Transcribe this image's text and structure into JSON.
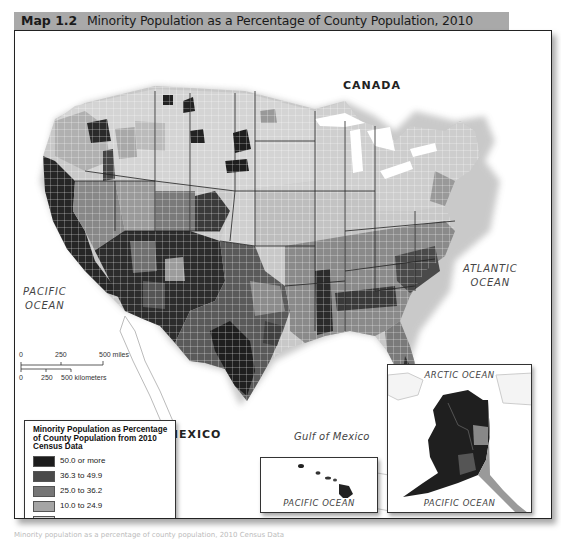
{
  "header": {
    "map_number": "Map 1.2",
    "title": "Minority Population as a Percentage of County Population, 2010",
    "background_color": "#a9a9a9"
  },
  "labels": {
    "canada": "CANADA",
    "mexico": "MEXICO",
    "pacific_ocean_line1": "PACIFIC",
    "pacific_ocean_line2": "OCEAN",
    "atlantic_ocean_line1": "ATLANTIC",
    "atlantic_ocean_line2": "OCEAN",
    "gulf_of_mexico": "Gulf of Mexico"
  },
  "scale_bar": {
    "miles": {
      "ticks": [
        "0",
        "250",
        "500 miles"
      ]
    },
    "kilometers": {
      "ticks": [
        "0",
        "250",
        "500 kilometers"
      ]
    }
  },
  "legend": {
    "title": "Minority Population as Percentage of County Population from 2010 Census Data",
    "items": [
      {
        "label": "50.0 or more",
        "color": "#1c1c1c"
      },
      {
        "label": "36.3 to 49.9",
        "color": "#4a4a4a"
      },
      {
        "label": "25.0 to 36.2",
        "color": "#767676"
      },
      {
        "label": "10.0 to 24.9",
        "color": "#a5a5a5"
      },
      {
        "label": "Less than 10.0",
        "color": "#d6d6d6"
      }
    ]
  },
  "insets": {
    "hawaii": {
      "ocean_label": "PACIFIC OCEAN"
    },
    "alaska": {
      "top_label": "ARCTIC OCEAN",
      "bottom_label": "PACIFIC OCEAN"
    }
  },
  "caption": "Minority population as a percentage of county population, 2010 Census Data"
}
